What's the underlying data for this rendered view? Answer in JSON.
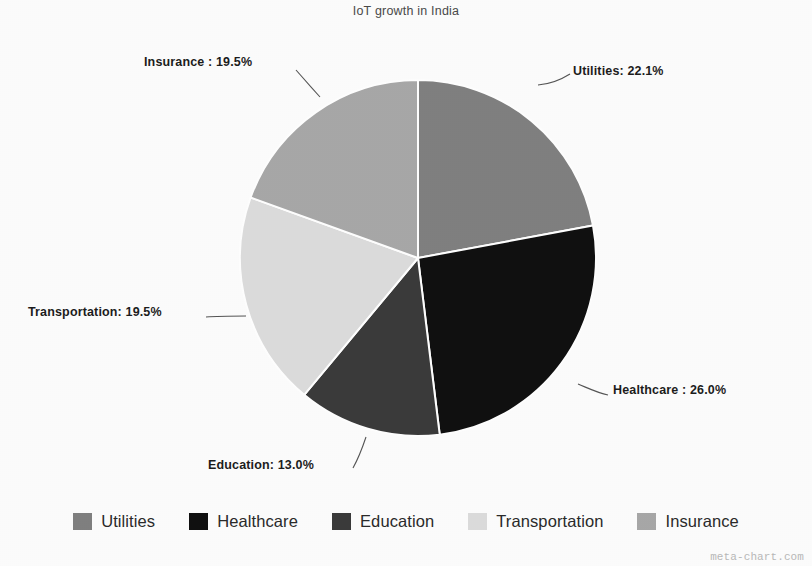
{
  "chart_data": {
    "type": "pie",
    "title": "IoT growth in India",
    "categories": [
      "Utilities",
      "Healthcare",
      "Education",
      "Transportation",
      "Insurance"
    ],
    "values": [
      22.1,
      26.0,
      13.0,
      19.5,
      19.5
    ],
    "value_unit": "%",
    "start_angle_deg": 0,
    "direction": "clockwise",
    "legend_position": "bottom",
    "grid": false,
    "xlabel": "",
    "ylabel": "",
    "slices": [
      {
        "name": "Utilities",
        "value": 22.1,
        "label": "Utilities: 22.1%",
        "color": "#808080",
        "sweep_deg": 79.56,
        "start_deg": 0.0
      },
      {
        "name": "Healthcare",
        "value": 26.0,
        "label": "Healthcare : 26.0%",
        "color": "#111111",
        "sweep_deg": 93.6,
        "start_deg": 79.56
      },
      {
        "name": "Education",
        "value": 13.0,
        "label": "Education: 13.0%",
        "color": "#3b3b3b",
        "sweep_deg": 46.8,
        "start_deg": 173.16
      },
      {
        "name": "Transportation",
        "value": 19.5,
        "label": "Transportation: 19.5%",
        "color": "#dcdcdc",
        "sweep_deg": 70.2,
        "start_deg": 219.96
      },
      {
        "name": "Insurance",
        "value": 19.5,
        "label": "Insurance : 19.5%",
        "color": "#a8a8a8",
        "sweep_deg": 70.2,
        "start_deg": 290.16
      }
    ]
  },
  "labels": {
    "utilities": "Utilities: 22.1%",
    "healthcare": "Healthcare : 26.0%",
    "education": "Education: 13.0%",
    "transportation": "Transportation: 19.5%",
    "insurance": "Insurance : 19.5%"
  },
  "legend": {
    "items": [
      {
        "label": "Utilities",
        "color": "#808080"
      },
      {
        "label": "Healthcare",
        "color": "#111111"
      },
      {
        "label": "Education",
        "color": "#3b3b3b"
      },
      {
        "label": "Transportation",
        "color": "#dcdcdc"
      },
      {
        "label": "Insurance",
        "color": "#a8a8a8"
      }
    ]
  },
  "watermark": "meta-chart.com"
}
